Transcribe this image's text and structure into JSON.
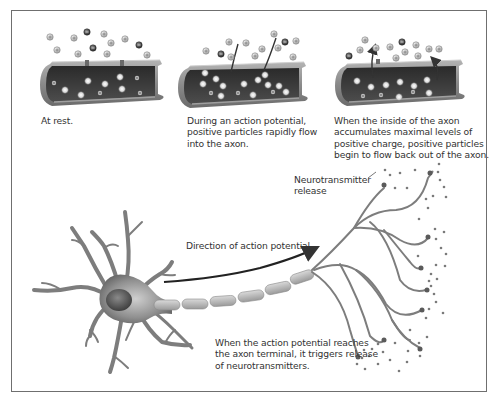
{
  "figure": {
    "panels": [
      {
        "id": "at-rest",
        "caption": "At rest."
      },
      {
        "id": "during-action-potential",
        "caption_lines": [
          "During an action potential,",
          "positive particles rapidly flow",
          "into the axon."
        ]
      },
      {
        "id": "repolarization",
        "caption_lines": [
          "When the inside of the axon",
          "accumulates maximal levels of",
          "positive charge, positive particles",
          "begin to flow back out of the axon."
        ]
      }
    ],
    "neuron": {
      "direction_label": "Direction of action potential",
      "release_label_lines": [
        "Neurotransmitter",
        "release"
      ],
      "terminal_caption_lines": [
        "When the action potential reaches",
        "the axon terminal, it triggers release",
        "of neurotransmitters."
      ]
    },
    "legend_symbols": {
      "positive_particle": "+",
      "negative_particle": "−"
    },
    "colors": {
      "frame": "#6f6f6f",
      "axon_outer": "#8e8e8e",
      "axon_inner": "#3a3a3a",
      "positive_particle": "#c8c8c8",
      "negative_particle": "#4a4a4a",
      "neuron": "#7a7a7a",
      "myelin": "#b9b9b9",
      "text": "#333333"
    }
  }
}
